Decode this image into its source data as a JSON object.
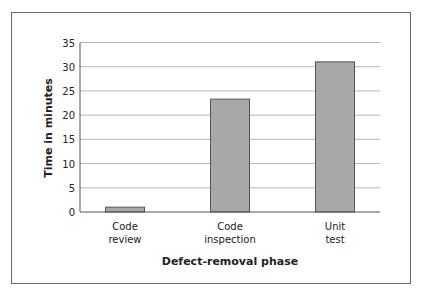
{
  "chart_data": {
    "type": "bar",
    "title": "",
    "xlabel": "Defect-removal phase",
    "ylabel": "Time in minutes",
    "categories": [
      "Code review",
      "Code inspection",
      "Unit test"
    ],
    "category_lines": [
      [
        "Code",
        "review"
      ],
      [
        "Code",
        "inspection"
      ],
      [
        "Unit",
        "test"
      ]
    ],
    "values": [
      1,
      23.3,
      31
    ],
    "ylim": [
      0,
      35
    ],
    "yticks": [
      0,
      5,
      10,
      15,
      20,
      25,
      30,
      35
    ],
    "grid": true,
    "legend": null,
    "colors": {
      "bar_fill": "#a8a8a8",
      "bar_stroke": "#555555",
      "grid": "#b5b5b5",
      "axis": "#555555"
    }
  }
}
